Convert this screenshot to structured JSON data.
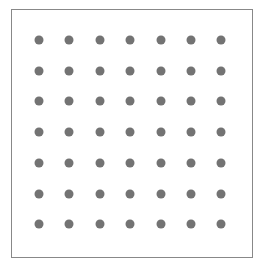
{
  "diagram": {
    "type": "dot-grid",
    "rows": 7,
    "columns": 7,
    "total_dots": 49,
    "dot_color": "#737373",
    "border_color": "#888888",
    "background_color": "#ffffff",
    "grid": {
      "x_start": 39,
      "y_start": 40,
      "x_step": 30.4,
      "y_step": 30.7
    }
  }
}
